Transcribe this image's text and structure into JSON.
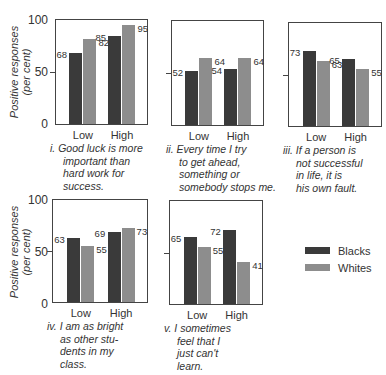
{
  "chart_data": [
    {
      "type": "bar",
      "title": "i. Good luck is more important than hard work for success.",
      "categories": [
        "Low",
        "High"
      ],
      "series": [
        {
          "name": "Blacks",
          "values": [
            68,
            85
          ]
        },
        {
          "name": "Whites",
          "values": [
            82,
            95
          ]
        }
      ],
      "xlabel": "",
      "ylabel": "Positive responses (per cent)",
      "ylim": [
        0,
        100
      ]
    },
    {
      "type": "bar",
      "title": "ii. Every time I try to get ahead, something or somebody stops me.",
      "categories": [
        "Low",
        "High"
      ],
      "series": [
        {
          "name": "Blacks",
          "values": [
            52,
            54
          ]
        },
        {
          "name": "Whites",
          "values": [
            64,
            64
          ]
        }
      ],
      "xlabel": "",
      "ylabel": "Positive responses (per cent)",
      "ylim": [
        0,
        100
      ]
    },
    {
      "type": "bar",
      "title": "iii. If a person is not successful in life, it is his own fault.",
      "categories": [
        "Low",
        "High"
      ],
      "series": [
        {
          "name": "Blacks",
          "values": [
            73,
            65
          ]
        },
        {
          "name": "Whites",
          "values": [
            63,
            55
          ]
        }
      ],
      "xlabel": "",
      "ylabel": "Positive responses (per cent)",
      "ylim": [
        0,
        100
      ]
    },
    {
      "type": "bar",
      "title": "iv. I am as bright as other students in my class.",
      "categories": [
        "Low",
        "High"
      ],
      "series": [
        {
          "name": "Blacks",
          "values": [
            63,
            69
          ]
        },
        {
          "name": "Whites",
          "values": [
            55,
            73
          ]
        }
      ],
      "xlabel": "",
      "ylabel": "Positive responses (per cent)",
      "ylim": [
        0,
        100
      ]
    },
    {
      "type": "bar",
      "title": "v. I sometimes feel that I just can't learn.",
      "categories": [
        "Low",
        "High"
      ],
      "series": [
        {
          "name": "Blacks",
          "values": [
            65,
            72
          ]
        },
        {
          "name": "Whites",
          "values": [
            55,
            41
          ]
        }
      ],
      "xlabel": "",
      "ylabel": "Positive responses (per cent)",
      "ylim": [
        0,
        100
      ]
    }
  ],
  "axis": {
    "ylabel_line1": "Positive responses",
    "ylabel_line2": "(per cent)",
    "ticks": [
      "100",
      "50",
      "0"
    ]
  },
  "legend": {
    "items": [
      {
        "label": "Blacks",
        "color": "#3a3a3a"
      },
      {
        "label": "Whites",
        "color": "#8d8d8d"
      }
    ]
  },
  "panels": [
    {
      "categories": [
        "Low",
        "High"
      ],
      "blacks": [
        68,
        85
      ],
      "whites": [
        82,
        95
      ],
      "blacks_labels": [
        "68",
        "85"
      ],
      "whites_labels": [
        "82",
        "95"
      ],
      "caption_num": "i.",
      "caption_lines": [
        "Good luck is more",
        "important than",
        "hard work for",
        "success."
      ]
    },
    {
      "categories": [
        "Low",
        "High"
      ],
      "blacks": [
        52,
        54
      ],
      "whites": [
        64,
        64
      ],
      "blacks_labels": [
        "52",
        "54"
      ],
      "whites_labels": [
        "64",
        "64"
      ],
      "caption_num": "ii.",
      "caption_lines": [
        "Every time I try",
        "to get ahead,",
        "something or",
        "somebody stops me."
      ]
    },
    {
      "categories": [
        "Low",
        "High"
      ],
      "blacks": [
        73,
        65
      ],
      "whites": [
        63,
        55
      ],
      "blacks_labels": [
        "73",
        "65"
      ],
      "whites_labels": [
        "63",
        "55"
      ],
      "caption_num": "iii.",
      "caption_lines": [
        "If a person is",
        "not successful",
        "in life, it is",
        "his own fault."
      ]
    },
    {
      "categories": [
        "Low",
        "High"
      ],
      "blacks": [
        63,
        69
      ],
      "whites": [
        55,
        73
      ],
      "blacks_labels": [
        "63",
        "69"
      ],
      "whites_labels": [
        "55",
        "73"
      ],
      "caption_num": "iv.",
      "caption_lines": [
        "I am as bright",
        "as other stu-",
        "dents in my",
        "class."
      ]
    },
    {
      "categories": [
        "Low",
        "High"
      ],
      "blacks": [
        65,
        72
      ],
      "whites": [
        55,
        41
      ],
      "blacks_labels": [
        "65",
        "72"
      ],
      "whites_labels": [
        "55",
        "41"
      ],
      "caption_num": "v.",
      "caption_lines": [
        "I sometimes",
        "feel that I",
        "just can't",
        "learn."
      ]
    }
  ]
}
